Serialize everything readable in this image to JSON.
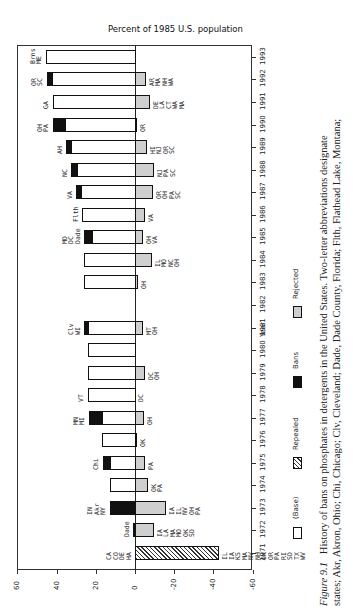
{
  "chart_data": {
    "type": "bar",
    "orientation": "rotated 90 degrees counter-clockwise (page in landscape)",
    "title": "Percent of 1985 U.S. population",
    "xlabel": "Year",
    "ylabel": "Percent of 1985 U.S. population",
    "ylim": [
      -60,
      60
    ],
    "yticks": [
      "60",
      "40",
      "20",
      "0",
      "-20",
      "-40",
      "-60"
    ],
    "categories": [
      "1971",
      "1972",
      "1973",
      "1974",
      "1975",
      "1976",
      "1977",
      "1978",
      "1979",
      "1980",
      "1981",
      "1982",
      "1983",
      "1984",
      "1985",
      "1986",
      "1987",
      "1988",
      "1989",
      "1990",
      "1991",
      "1992",
      "1993"
    ],
    "series": [
      {
        "name": "(Base)",
        "values": [
          0,
          0,
          0,
          13,
          13,
          17,
          17,
          24,
          24,
          24,
          24,
          0,
          26,
          26,
          22,
          27,
          27.5,
          29.5,
          32.5,
          35.5,
          42,
          42.5,
          45.5
        ]
      },
      {
        "name": "Bans",
        "values": [
          0,
          1,
          13,
          0,
          3.5,
          0,
          6.5,
          0,
          0,
          0,
          2,
          0,
          0,
          0,
          4,
          0,
          2.5,
          3,
          2.5,
          6.5,
          0,
          2.5,
          0
        ]
      },
      {
        "name": "Repealed",
        "values": [
          -43,
          0,
          0,
          0,
          0,
          0,
          0,
          0,
          0,
          0,
          0,
          0,
          0,
          0,
          0,
          0,
          0,
          0,
          0,
          0,
          0,
          0,
          0
        ]
      },
      {
        "name": "Rejected",
        "values": [
          0,
          -9.5,
          -16,
          -6.5,
          -5,
          -1,
          -4.5,
          0,
          -5,
          0,
          -4,
          0,
          -1.5,
          -8.5,
          -4,
          -5,
          -9,
          -9.5,
          -6,
          -1,
          -7.5,
          -5.5,
          0
        ]
      }
    ],
    "annotations": {
      "1971": {
        "above": [
          "CA",
          "CO",
          "DE",
          "HA"
        ],
        "below": [
          "IL",
          "IA",
          "KS",
          "MA",
          "NV",
          "NH",
          "OK",
          "OR",
          "PA",
          "RI",
          "SD",
          "TX",
          "WV"
        ]
      },
      "1972": {
        "above": [
          "Dade"
        ],
        "below": [
          "IA",
          "LA",
          "MA",
          "MO",
          "OK",
          "SD"
        ]
      },
      "1973": {
        "above": [
          "IN",
          "Akr",
          "NY"
        ],
        "below": [
          "IA",
          "IL",
          "NV",
          "OH",
          "PA"
        ]
      },
      "1974": {
        "above": [],
        "below": [
          "OK",
          "PA"
        ]
      },
      "1975": {
        "above": [
          "Chi"
        ],
        "below": [
          "PA"
        ]
      },
      "1976": {
        "above": [],
        "below": [
          "OK"
        ]
      },
      "1977": {
        "above": [
          "MN",
          "MI"
        ],
        "below": [
          "OH"
        ]
      },
      "1978": {
        "above": [
          "VT"
        ],
        "below": [
          "DC"
        ]
      },
      "1979": {
        "above": [],
        "below": [
          "DC",
          "OH"
        ]
      },
      "1981": {
        "above": [
          "Clv",
          "WI"
        ],
        "below": [
          "MT",
          "OH"
        ]
      },
      "1983": {
        "above": [],
        "below": [
          "OH"
        ]
      },
      "1984": {
        "above": [],
        "below": [
          "IL",
          "MO",
          "NC",
          "OH"
        ]
      },
      "1985": {
        "above": [
          "MD",
          "DC",
          "Dade"
        ],
        "below": [
          "OH",
          "VA"
        ]
      },
      "1986": {
        "above": [
          "Flth"
        ],
        "below": [
          "VA"
        ]
      },
      "1987": {
        "above": [
          "VA"
        ],
        "below": [
          "OR",
          "OH",
          "PA",
          "SC"
        ]
      },
      "1988": {
        "above": [
          "NC"
        ],
        "below": [
          "NJ",
          "PA",
          "SC"
        ]
      },
      "1989": {
        "above": [
          "AH"
        ],
        "below": [
          "HI",
          "NJ",
          "OR",
          "SC"
        ]
      },
      "1990": {
        "above": [
          "OH",
          "PA"
        ],
        "below": [
          "OR"
        ]
      },
      "1991": {
        "above": [
          "GA"
        ],
        "below": [
          "DE",
          "LA",
          "CT",
          "WA",
          "MA"
        ]
      },
      "1992": {
        "above": [
          "OR",
          "SC"
        ],
        "below": [
          "AR",
          "MA",
          "NH",
          "WA"
        ]
      },
      "1993": {
        "above": [
          "Brns",
          "ME"
        ],
        "below": []
      }
    },
    "legend": [
      "(Base)",
      "Repealed",
      "Bans",
      "Rejected"
    ],
    "legend_position": "bottom (rotated: right side)",
    "grid": false
  },
  "figure": {
    "title": "Percent of 1985 U.S. population",
    "year_axis_label": "Year",
    "legend": {
      "base": "(Base)",
      "repealed": "Repealed",
      "bans": "Bans",
      "rejected": "Rejected"
    },
    "caption_label": "Figure 9.1",
    "caption_line1": "History of bans on phosphates in detergents in the United States. Two-letter abbreviations designate",
    "caption_line2": "states; Akr, Akron, Ohio; Chi, Chicago; Clv, Cleveland; Dade, Dade County, Florida; Flth, Flathead Lake, Montana;"
  }
}
